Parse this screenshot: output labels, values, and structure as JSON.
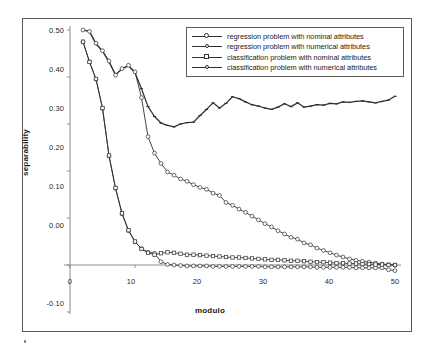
{
  "chart_data": {
    "type": "line",
    "title": "",
    "xlabel": "modulo",
    "ylabel": "separability",
    "xlim": [
      0,
      51
    ],
    "ylim": [
      -0.1,
      0.5
    ],
    "xticks": [
      0,
      10,
      20,
      30,
      40,
      50
    ],
    "xtick_labels": [
      "0",
      "10",
      "20",
      "30",
      "40",
      "50"
    ],
    "yticks": [
      -0.1,
      0.0,
      0.1,
      0.2,
      0.3,
      0.4,
      0.5
    ],
    "ytick_labels": [
      "-0.10",
      "0.00",
      "0.10",
      "0.20",
      "0.30",
      "0.40",
      "0.50"
    ],
    "grid": false,
    "legend_position": "top-right",
    "x": [
      2,
      3,
      4,
      5,
      6,
      7,
      8,
      9,
      10,
      11,
      12,
      13,
      14,
      15,
      16,
      17,
      18,
      19,
      20,
      21,
      22,
      23,
      24,
      25,
      26,
      27,
      28,
      29,
      30,
      31,
      32,
      33,
      34,
      35,
      36,
      37,
      38,
      39,
      40,
      41,
      42,
      43,
      44,
      45,
      46,
      47,
      48,
      49,
      50
    ],
    "series": [
      {
        "name": "regression problem with nominal attributes",
        "marker": "circle",
        "values": [
          0.475,
          0.432,
          0.395,
          0.333,
          0.232,
          0.163,
          0.109,
          0.073,
          0.049,
          0.035,
          0.027,
          0.025,
          0.007,
          0.001,
          0.0,
          -0.001,
          -0.002,
          -0.002,
          -0.002,
          -0.002,
          -0.003,
          -0.003,
          -0.003,
          -0.003,
          -0.003,
          -0.003,
          -0.003,
          -0.003,
          -0.004,
          -0.004,
          -0.004,
          -0.004,
          -0.004,
          -0.004,
          -0.004,
          -0.004,
          -0.005,
          -0.005,
          -0.005,
          -0.005,
          -0.005,
          -0.005,
          -0.006,
          -0.006,
          -0.006,
          -0.006,
          -0.006,
          -0.01,
          -0.012
        ]
      },
      {
        "name": "regression problem with numerical attributes",
        "marker": "dash",
        "values": [
          0.5,
          0.497,
          0.47,
          0.455,
          0.432,
          0.405,
          0.417,
          0.424,
          0.409,
          0.375,
          0.337,
          0.316,
          0.302,
          0.297,
          0.294,
          0.3,
          0.303,
          0.304,
          0.318,
          0.331,
          0.345,
          0.334,
          0.344,
          0.358,
          0.354,
          0.347,
          0.341,
          0.338,
          0.334,
          0.331,
          0.336,
          0.343,
          0.337,
          0.345,
          0.336,
          0.338,
          0.341,
          0.34,
          0.344,
          0.343,
          0.347,
          0.346,
          0.348,
          0.349,
          0.347,
          0.345,
          0.348,
          0.351,
          0.359
        ]
      },
      {
        "name": "classification problem with nominal attributes",
        "marker": "open-circle",
        "values": [
          0.5,
          0.497,
          0.472,
          0.456,
          0.434,
          0.404,
          0.418,
          0.425,
          0.411,
          0.356,
          0.273,
          0.238,
          0.216,
          0.198,
          0.191,
          0.183,
          0.178,
          0.171,
          0.165,
          0.161,
          0.153,
          0.148,
          0.133,
          0.127,
          0.119,
          0.112,
          0.104,
          0.096,
          0.088,
          0.081,
          0.073,
          0.066,
          0.059,
          0.055,
          0.047,
          0.043,
          0.036,
          0.031,
          0.026,
          0.021,
          0.017,
          0.013,
          0.01,
          0.008,
          0.006,
          0.004,
          0.002,
          0.001,
          0.0
        ]
      },
      {
        "name": "classification problem with numerical attributes",
        "marker": "square",
        "values": [
          0.475,
          0.432,
          0.396,
          0.334,
          0.233,
          0.164,
          0.11,
          0.074,
          0.05,
          0.034,
          0.026,
          0.022,
          0.025,
          0.027,
          0.026,
          0.024,
          0.022,
          0.022,
          0.021,
          0.02,
          0.019,
          0.018,
          0.017,
          0.016,
          0.016,
          0.015,
          0.014,
          0.013,
          0.012,
          0.011,
          0.011,
          0.01,
          0.009,
          0.009,
          0.008,
          0.007,
          0.006,
          0.006,
          0.005,
          0.004,
          0.004,
          0.003,
          0.003,
          0.002,
          0.002,
          0.001,
          0.001,
          0.0,
          0.0
        ]
      }
    ]
  },
  "axes": {
    "ylabel": "separability",
    "xlabel": "modulo",
    "ytick_labels": [
      "0.50",
      "0.40",
      "0.30",
      "0.20",
      "0.10",
      "0.00",
      "-0.10"
    ],
    "xtick_labels": [
      "0",
      "10",
      "20",
      "30",
      "40",
      "50"
    ]
  },
  "legend": {
    "items": [
      {
        "label": "regression problem with nominal attributes",
        "marker": "circle"
      },
      {
        "label": "regression problem with numerical attributes",
        "marker": "dot"
      },
      {
        "label": "classification problem with nominal attributes",
        "marker": "square"
      },
      {
        "label": "classification problem with numerical attributes",
        "marker": "dot"
      }
    ]
  },
  "colors": {
    "line": "#303030",
    "axis": "#8c8c8c",
    "frame": "#5a5a5a",
    "text": "#1c1c1c",
    "background": "#ffffff"
  }
}
